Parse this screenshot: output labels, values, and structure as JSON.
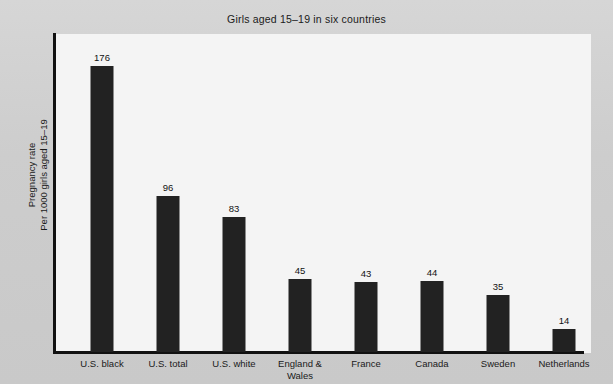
{
  "chart_data": {
    "type": "bar",
    "title": "Girls aged 15–19 in six countries",
    "xlabel": "",
    "ylabel": "Pregnancy rate\nPer 1000 girls aged 15–19",
    "ylabel_lines": [
      "Pregnancy rate",
      "Per 1000 girls aged 15–19"
    ],
    "categories": [
      "U.S. black",
      "U.S. total",
      "U.S. white",
      "England & Wales",
      "France",
      "Canada",
      "Sweden",
      "Netherlands"
    ],
    "category_lines": [
      [
        "U.S. black"
      ],
      [
        "U.S. total"
      ],
      [
        "U.S. white"
      ],
      [
        "England &",
        "Wales"
      ],
      [
        "France"
      ],
      [
        "Canada"
      ],
      [
        "Sweden"
      ],
      [
        "Netherlands"
      ]
    ],
    "values": [
      176,
      96,
      83,
      45,
      43,
      44,
      35,
      14
    ],
    "value_labels": [
      "176",
      "96",
      "83",
      "45",
      "43",
      "44",
      "35",
      "14"
    ],
    "ylim": [
      0,
      196
    ],
    "grid": false,
    "legend": false,
    "bar_color": "#222222",
    "plot_background": "#f4f4f4",
    "figure_background": "#cfcfcf",
    "axis_color": "#111111"
  }
}
